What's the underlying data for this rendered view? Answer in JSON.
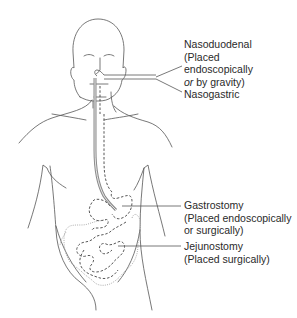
{
  "diagram": {
    "colors": {
      "background": "#ffffff",
      "line": "#555555",
      "text": "#2a2a2a",
      "tube": "#8a8a8a"
    },
    "labels": {
      "nasoduodenal": {
        "title": "Nasoduodenal",
        "line1": "(Placed",
        "line2": "endoscopically",
        "line3_italic": "or",
        "line3_rest": " by gravity)"
      },
      "nasogastric": {
        "title": "Nasogastric"
      },
      "gastrostomy": {
        "title": "Gastrostomy",
        "line1": "(Placed endoscopically",
        "line2": "or surgically)"
      },
      "jejunostomy": {
        "title": "Jejunostomy",
        "line1": "(Placed surgically)"
      }
    }
  }
}
